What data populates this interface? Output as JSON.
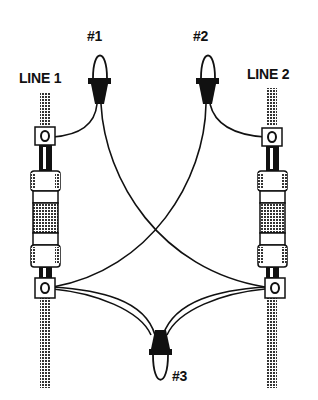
{
  "diagram": {
    "labels": {
      "line1": "LINE 1",
      "line2": "LINE 2",
      "connector1": "#1",
      "connector2": "#2",
      "connector3": "#3"
    },
    "colors": {
      "ink": "#111111",
      "background": "#ffffff",
      "hatch": "#555555"
    },
    "components": [
      {
        "name": "line-1-cable",
        "type": "cable"
      },
      {
        "name": "line-2-cable",
        "type": "cable"
      },
      {
        "name": "line-1-fuse-holder",
        "type": "fuse"
      },
      {
        "name": "line-2-fuse-holder",
        "type": "fuse"
      },
      {
        "name": "wire-nut-1",
        "label": "#1"
      },
      {
        "name": "wire-nut-2",
        "label": "#2"
      },
      {
        "name": "wire-nut-3",
        "label": "#3"
      }
    ]
  }
}
